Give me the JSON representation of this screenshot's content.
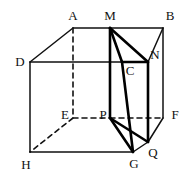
{
  "figure": {
    "canvas": {
      "width": 192,
      "height": 176
    },
    "colors": {
      "background": "#ffffff",
      "stroke": "#111111",
      "stroke_heavy": "#000000"
    },
    "stroke_widths": {
      "thin": 1.5,
      "heavy": 2.6,
      "dashed": 1.6
    },
    "dash_pattern": "5,4"
  },
  "vertices": {
    "A": {
      "label": "A",
      "x": 73,
      "y": 28,
      "label_x": 73,
      "label_y": 15
    },
    "B": {
      "label": "B",
      "x": 163,
      "y": 28,
      "label_x": 170,
      "label_y": 15
    },
    "C": {
      "label": "C",
      "x": 122,
      "y": 62,
      "label_x": 130,
      "label_y": 70
    },
    "D": {
      "label": "D",
      "x": 30,
      "y": 62,
      "label_x": 20,
      "label_y": 61
    },
    "E": {
      "label": "E",
      "x": 73,
      "y": 118,
      "label_x": 65,
      "label_y": 114
    },
    "F": {
      "label": "F",
      "x": 163,
      "y": 118,
      "label_x": 175,
      "label_y": 114
    },
    "G": {
      "label": "G",
      "x": 133,
      "y": 152,
      "label_x": 134,
      "label_y": 163
    },
    "H": {
      "label": "H",
      "x": 30,
      "y": 152,
      "label_x": 26,
      "label_y": 164
    },
    "M": {
      "label": "M",
      "x": 110,
      "y": 28,
      "label_x": 110,
      "label_y": 15
    },
    "N": {
      "label": "N",
      "x": 148,
      "y": 62,
      "label_x": 155,
      "label_y": 54
    },
    "P": {
      "label": "P",
      "x": 110,
      "y": 118,
      "label_x": 103,
      "label_y": 114
    },
    "Q": {
      "label": "Q",
      "x": 148,
      "y": 142,
      "label_x": 153,
      "label_y": 152
    }
  },
  "edges": {
    "solid_thin": [
      {
        "name": "edge-A-M",
        "from": "A",
        "to": "M"
      },
      {
        "name": "edge-M-B",
        "from": "M",
        "to": "B"
      },
      {
        "name": "edge-A-D",
        "from": "A",
        "to": "D"
      },
      {
        "name": "edge-D-C",
        "from": "D",
        "to": "C"
      },
      {
        "name": "edge-C-N",
        "from": "C",
        "to": "N"
      },
      {
        "name": "edge-N-B",
        "from": "N",
        "to": "B"
      },
      {
        "name": "edge-D-H",
        "from": "D",
        "to": "H"
      },
      {
        "name": "edge-B-F",
        "from": "B",
        "to": "F"
      },
      {
        "name": "edge-H-G",
        "from": "H",
        "to": "G"
      },
      {
        "name": "edge-G-Q",
        "from": "G",
        "to": "Q"
      },
      {
        "name": "edge-Q-F",
        "from": "Q",
        "to": "F"
      }
    ],
    "solid_heavy": [
      {
        "name": "prism-edge-M-C",
        "from": "M",
        "to": "C"
      },
      {
        "name": "prism-edge-M-N",
        "from": "M",
        "to": "N"
      },
      {
        "name": "prism-edge-C-N",
        "from": "C",
        "to": "N"
      },
      {
        "name": "prism-edge-M-P",
        "from": "M",
        "to": "P"
      },
      {
        "name": "prism-edge-C-G",
        "from": "C",
        "to": "G"
      },
      {
        "name": "prism-edge-N-Q",
        "from": "N",
        "to": "Q"
      },
      {
        "name": "prism-edge-P-G",
        "from": "P",
        "to": "G"
      },
      {
        "name": "prism-edge-P-Q",
        "from": "P",
        "to": "Q"
      }
    ],
    "dashed_hidden": [
      {
        "name": "hidden-edge-A-E",
        "from": "A",
        "to": "E"
      },
      {
        "name": "hidden-edge-E-P",
        "from": "E",
        "to": "P"
      },
      {
        "name": "hidden-edge-P-F",
        "from": "P",
        "to": "F"
      },
      {
        "name": "hidden-edge-E-H",
        "from": "E",
        "to": "H"
      }
    ]
  },
  "labels": [
    {
      "key": "A",
      "text": "A"
    },
    {
      "key": "M",
      "text": "M"
    },
    {
      "key": "B",
      "text": "B"
    },
    {
      "key": "D",
      "text": "D"
    },
    {
      "key": "N",
      "text": "N"
    },
    {
      "key": "C",
      "text": "C"
    },
    {
      "key": "E",
      "text": "E"
    },
    {
      "key": "P",
      "text": "P"
    },
    {
      "key": "F",
      "text": "F"
    },
    {
      "key": "Q",
      "text": "Q"
    },
    {
      "key": "H",
      "text": "H"
    },
    {
      "key": "G",
      "text": "G"
    }
  ]
}
